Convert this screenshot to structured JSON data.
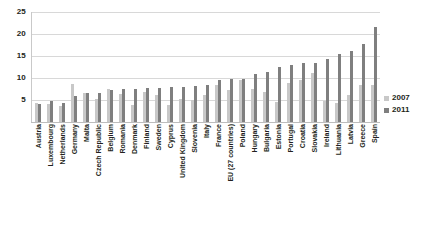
{
  "chart_data": {
    "type": "bar",
    "title": "",
    "subtitle": "",
    "xlabel": "",
    "ylabel": "",
    "ylim": [
      0,
      25
    ],
    "yticks": [
      0,
      5,
      10,
      15,
      20,
      25
    ],
    "ytick_labels": [
      "",
      "5",
      "10",
      "15",
      "20",
      "25"
    ],
    "grid": true,
    "legend_position": "right",
    "categories": [
      "Austria",
      "Luxembourg",
      "Netherlands",
      "Germany",
      "Malta",
      "Czech Republic",
      "Belgium",
      "Romania",
      "Denmark",
      "Finland",
      "Sweden",
      "Cyprus",
      "United Kingdom",
      "Slovenia",
      "Italy",
      "France",
      "EU (27 countries)",
      "Poland",
      "Hungary",
      "Bulgaria",
      "Estonia",
      "Portugal",
      "Croatia",
      "Slovakia",
      "Ireland",
      "Lithuania",
      "Latvia",
      "Greece",
      "Spain"
    ],
    "series": [
      {
        "name": "2007",
        "color": "#c8c8c8",
        "values": [
          4.4,
          4.2,
          3.6,
          8.7,
          6.5,
          5.3,
          7.5,
          6.4,
          3.8,
          6.9,
          6.1,
          3.9,
          5.3,
          4.9,
          6.1,
          8.4,
          7.2,
          9.6,
          7.4,
          6.9,
          4.6,
          8.9,
          9.6,
          11.2,
          4.7,
          4.3,
          6.1,
          8.4,
          8.3
        ]
      },
      {
        "name": "2011",
        "color": "#7f7f7f",
        "values": [
          4.2,
          4.8,
          4.4,
          5.9,
          6.5,
          6.7,
          7.2,
          7.4,
          7.6,
          7.8,
          7.8,
          7.9,
          8.0,
          8.2,
          8.4,
          9.6,
          9.7,
          9.7,
          10.9,
          11.3,
          12.5,
          12.9,
          13.5,
          13.5,
          14.4,
          15.4,
          16.2,
          17.7,
          21.7
        ]
      }
    ]
  },
  "legend": {
    "items": [
      {
        "label": "2007",
        "color": "#c8c8c8"
      },
      {
        "label": "2011",
        "color": "#7f7f7f"
      }
    ]
  }
}
